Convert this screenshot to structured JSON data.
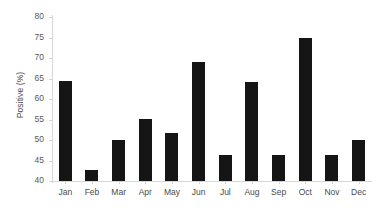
{
  "chart_data": {
    "type": "bar",
    "title": "",
    "xlabel": "",
    "ylabel": "Positive (%)",
    "categories": [
      "Jan",
      "Feb",
      "Mar",
      "Apr",
      "May",
      "Jun",
      "Jul",
      "Aug",
      "Sep",
      "Oct",
      "Nov",
      "Dec"
    ],
    "values": [
      64.3,
      42.8,
      50.0,
      55.2,
      51.7,
      69.0,
      46.3,
      64.2,
      46.3,
      75.0,
      46.3,
      50.0
    ],
    "series": [
      {
        "name": "Positive (%)",
        "values": [
          64.3,
          42.8,
          50.0,
          55.2,
          51.7,
          69.0,
          46.3,
          64.2,
          46.3,
          75.0,
          46.3,
          50.0
        ]
      }
    ],
    "ylim": [
      40,
      80
    ],
    "ytick_step": 5,
    "ytick_labels": [
      "40",
      "45",
      "50",
      "55",
      "60",
      "65",
      "70",
      "75",
      "80"
    ],
    "ytick_values": [
      40,
      45,
      50,
      55,
      60,
      65,
      70,
      75,
      80
    ],
    "grid": false,
    "legend": null,
    "bar_color": "#151515",
    "axis_color": "#d6d6d6",
    "tick_label_color": "#595959",
    "background": "#ffffff"
  }
}
